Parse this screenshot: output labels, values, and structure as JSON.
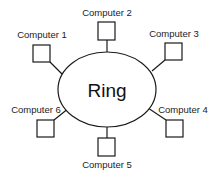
{
  "diagram": {
    "type": "ring-network-topology",
    "center": {
      "label": "Ring",
      "shape": "ellipse"
    },
    "nodes": [
      {
        "id": "computer-1",
        "label": "Computer 1",
        "shape": "square"
      },
      {
        "id": "computer-2",
        "label": "Computer 2",
        "shape": "square"
      },
      {
        "id": "computer-3",
        "label": "Computer 3",
        "shape": "square"
      },
      {
        "id": "computer-4",
        "label": "Computer 4",
        "shape": "square"
      },
      {
        "id": "computer-5",
        "label": "Computer 5",
        "shape": "square"
      },
      {
        "id": "computer-6",
        "label": "Computer 6",
        "shape": "square"
      }
    ],
    "edges": [
      {
        "from": "computer-1",
        "to": "ring"
      },
      {
        "from": "computer-2",
        "to": "ring"
      },
      {
        "from": "computer-3",
        "to": "ring"
      },
      {
        "from": "computer-4",
        "to": "ring"
      },
      {
        "from": "computer-5",
        "to": "ring"
      },
      {
        "from": "computer-6",
        "to": "ring"
      }
    ],
    "colors": {
      "stroke": "#1a1a1a",
      "text": "#222222",
      "background": "#ffffff"
    }
  }
}
